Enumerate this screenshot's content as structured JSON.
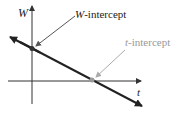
{
  "diagram": {
    "axes": {
      "vertical_label": "W",
      "horizontal_label": "t"
    },
    "annotations": {
      "w_intercept": {
        "label_italic": "W",
        "label_rest": "-intercept"
      },
      "t_intercept": {
        "label_italic": "t",
        "label_rest": "-intercept"
      }
    },
    "colors": {
      "axis": "#333333",
      "line": "#222222",
      "w_arrow": "#555555",
      "t_arrow": "#aaaaaa",
      "t_label": "#999999",
      "w_label": "#222222"
    }
  }
}
